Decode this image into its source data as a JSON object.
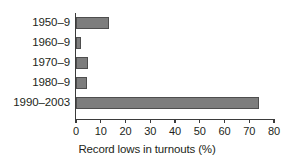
{
  "chart_data": {
    "type": "bar",
    "orientation": "horizontal",
    "title": "",
    "xlabel": "Record lows in turnouts (%)",
    "ylabel": "",
    "categories": [
      "1950–9",
      "1960–9",
      "1970–9",
      "1980–9",
      "1990–2003"
    ],
    "values": [
      13.5,
      2,
      5,
      4.5,
      74
    ],
    "xlim": [
      0,
      80
    ],
    "xticks": [
      0,
      10,
      20,
      30,
      40,
      50,
      60,
      70,
      80
    ],
    "xtick_labels": [
      "0",
      "10",
      "20",
      "30",
      "40",
      "50",
      "60",
      "70",
      "80"
    ],
    "grid": false,
    "legend": null,
    "bar_color": "#7d7d7d",
    "bar_edge_color": "#4e4e4e",
    "axis_color": "#3b3b3b",
    "background_color": "#ffffff"
  }
}
